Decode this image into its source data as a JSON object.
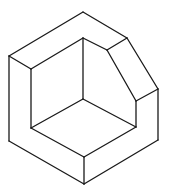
{
  "diagram": {
    "type": "isometric-line-drawing",
    "stroke_color": "#1a1a1a",
    "background_color": "#ffffff",
    "vertices": {
      "top_outer": [
        83,
        12
      ],
      "left_outer_top": [
        9,
        56
      ],
      "left_outer_bottom": [
        9,
        141
      ],
      "bottom": [
        84,
        184
      ],
      "front_top": [
        84,
        157
      ],
      "right_outer_bottom": [
        158,
        140
      ],
      "right_outer_top": [
        158,
        89
      ],
      "chamfer_outer_top": [
        127,
        38
      ],
      "inner_left_top": [
        31,
        69
      ],
      "inner_left_bottom": [
        31,
        128
      ],
      "inner_back_corner": [
        83,
        38
      ],
      "inner_floor_corner": [
        83,
        99
      ],
      "chamfer_inner_top": [
        107,
        50
      ],
      "chamfer_inner_bottom": [
        136,
        101
      ],
      "inner_right_bottom": [
        136,
        127
      ]
    },
    "edges": [
      [
        "top_outer",
        "left_outer_top"
      ],
      [
        "top_outer",
        "chamfer_outer_top"
      ],
      [
        "chamfer_outer_top",
        "right_outer_top"
      ],
      [
        "left_outer_top",
        "left_outer_bottom"
      ],
      [
        "left_outer_bottom",
        "bottom"
      ],
      [
        "bottom",
        "right_outer_bottom"
      ],
      [
        "right_outer_bottom",
        "right_outer_top"
      ],
      [
        "bottom",
        "front_top"
      ],
      [
        "front_top",
        "inner_left_bottom"
      ],
      [
        "front_top",
        "inner_right_bottom"
      ],
      [
        "left_outer_top",
        "inner_left_top"
      ],
      [
        "inner_left_top",
        "inner_left_bottom"
      ],
      [
        "inner_left_top",
        "inner_back_corner"
      ],
      [
        "inner_back_corner",
        "inner_floor_corner"
      ],
      [
        "inner_back_corner",
        "chamfer_inner_top"
      ],
      [
        "inner_floor_corner",
        "inner_left_bottom"
      ],
      [
        "inner_floor_corner",
        "inner_right_bottom"
      ],
      [
        "chamfer_inner_top",
        "chamfer_outer_top"
      ],
      [
        "chamfer_inner_top",
        "chamfer_inner_bottom"
      ],
      [
        "chamfer_inner_bottom",
        "right_outer_top"
      ],
      [
        "chamfer_inner_bottom",
        "inner_right_bottom"
      ]
    ]
  }
}
